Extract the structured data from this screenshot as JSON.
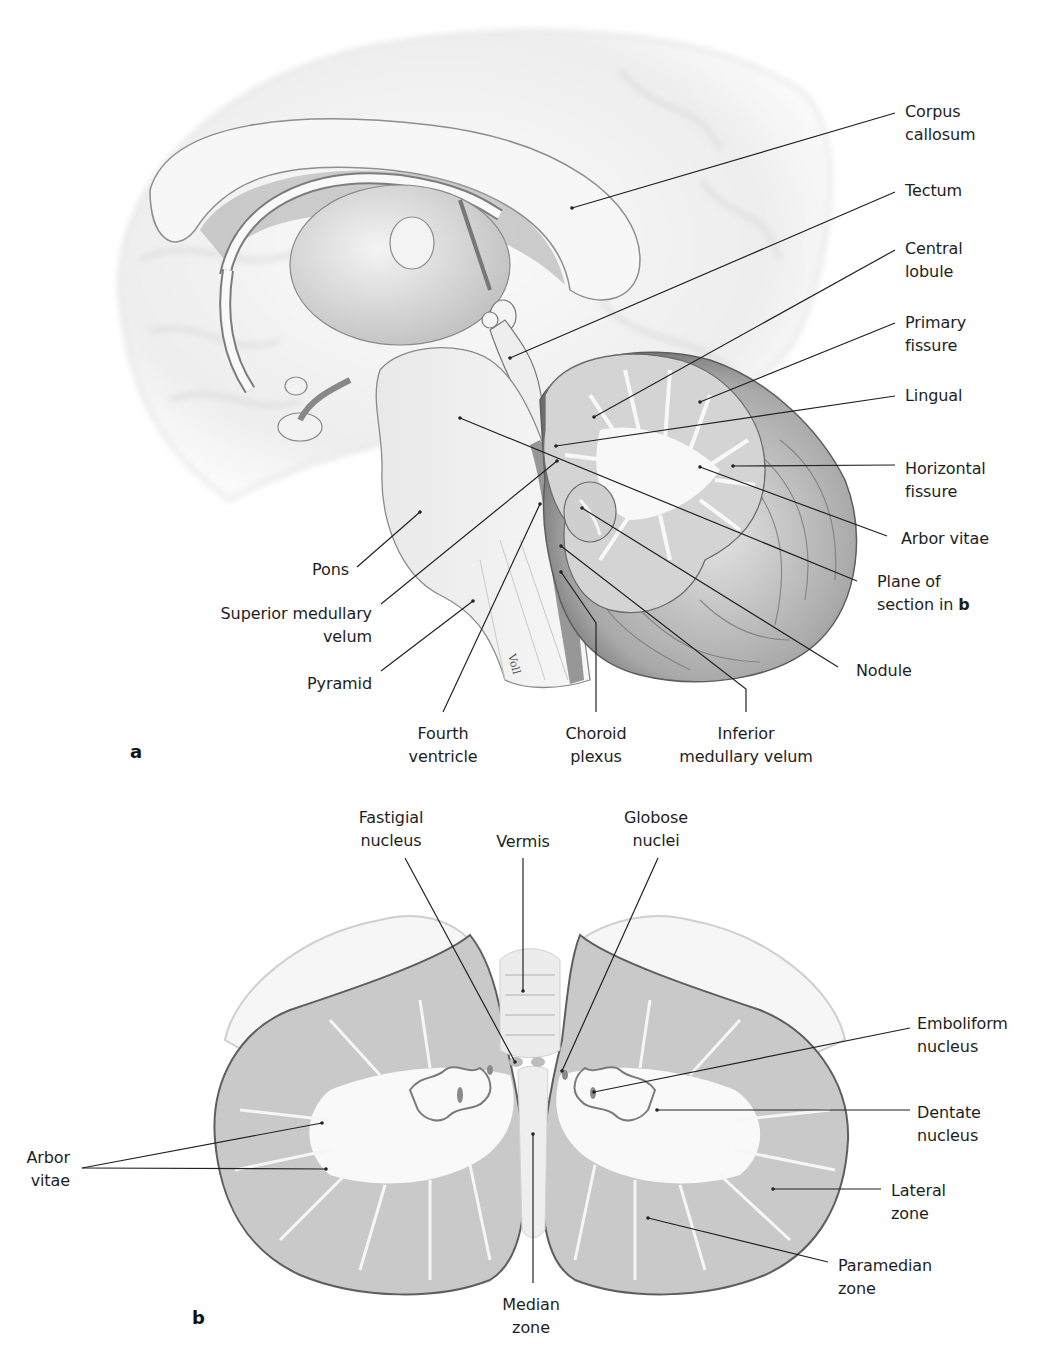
{
  "figure": {
    "panel_a": {
      "letter": "a",
      "labels": [
        {
          "id": "corpus-callosum",
          "text": "Corpus\ncallosum",
          "x": 905,
          "y": 100,
          "align": "left"
        },
        {
          "id": "tectum",
          "text": "Tectum",
          "x": 905,
          "y": 179,
          "align": "left"
        },
        {
          "id": "central-lobule",
          "text": "Central\nlobule",
          "x": 905,
          "y": 237,
          "align": "left"
        },
        {
          "id": "primary-fissure",
          "text": "Primary\nfissure",
          "x": 905,
          "y": 311,
          "align": "left"
        },
        {
          "id": "lingual",
          "text": "Lingual",
          "x": 905,
          "y": 384,
          "align": "left"
        },
        {
          "id": "horizontal-fissure",
          "text": "Horizontal\nfissure",
          "x": 905,
          "y": 457,
          "align": "left"
        },
        {
          "id": "arbor-vitae-a",
          "text": "Arbor vitae",
          "x": 901,
          "y": 527,
          "align": "left"
        },
        {
          "id": "plane-of-section",
          "text": "Plane of\nsection in ",
          "bold_suffix": "b",
          "x": 877,
          "y": 570,
          "align": "left"
        },
        {
          "id": "nodule",
          "text": "Nodule",
          "x": 856,
          "y": 659,
          "align": "left"
        },
        {
          "id": "pons",
          "text": "Pons",
          "x": 349,
          "y": 558,
          "align": "right"
        },
        {
          "id": "superior-medullary-velum",
          "text": "Superior medullary\nvelum",
          "x": 372,
          "y": 602,
          "align": "right"
        },
        {
          "id": "pyramid",
          "text": "Pyramid",
          "x": 372,
          "y": 672,
          "align": "right"
        },
        {
          "id": "fourth-ventricle",
          "text": "Fourth\nventricle",
          "x": 443,
          "y": 722,
          "align": "center"
        },
        {
          "id": "choroid-plexus",
          "text": "Choroid\nplexus",
          "x": 596,
          "y": 722,
          "align": "center"
        },
        {
          "id": "inferior-medullary-velum",
          "text": "Inferior\nmedullary velum",
          "x": 746,
          "y": 722,
          "align": "center"
        }
      ],
      "leaders": [
        {
          "for": "corpus-callosum",
          "points": [
            [
              895,
              113
            ],
            [
              572,
              208
            ]
          ]
        },
        {
          "for": "tectum",
          "points": [
            [
              895,
              192
            ],
            [
              510,
              358
            ]
          ]
        },
        {
          "for": "central-lobule",
          "points": [
            [
              895,
              250
            ],
            [
              594,
              417
            ]
          ]
        },
        {
          "for": "primary-fissure",
          "points": [
            [
              895,
              323
            ],
            [
              700,
              402
            ]
          ]
        },
        {
          "for": "lingual",
          "points": [
            [
              895,
              396
            ],
            [
              556,
              446
            ]
          ]
        },
        {
          "for": "horizontal-fissure",
          "points": [
            [
              895,
              465
            ],
            [
              733,
              466
            ]
          ]
        },
        {
          "for": "arbor-vitae-a",
          "points": [
            [
              887,
              536
            ],
            [
              700,
              467
            ]
          ]
        },
        {
          "for": "plane-of-section",
          "points": [
            [
              857,
              581
            ],
            [
              460,
              418
            ]
          ]
        },
        {
          "for": "nodule",
          "points": [
            [
              838,
              667
            ],
            [
              582,
              508
            ]
          ]
        },
        {
          "for": "pons",
          "points": [
            [
              357,
              567
            ],
            [
              420,
              512
            ]
          ]
        },
        {
          "for": "superior-medullary-velum",
          "points": [
            [
              381,
              604
            ],
            [
              557,
              461
            ]
          ]
        },
        {
          "for": "pyramid",
          "points": [
            [
              381,
              671
            ],
            [
              473,
              601
            ]
          ]
        },
        {
          "for": "fourth-ventricle",
          "points": [
            [
              443,
              712
            ],
            [
              540,
              504
            ]
          ]
        },
        {
          "for": "choroid-plexus",
          "points": [
            [
              596,
              712
            ],
            [
              596,
              623
            ],
            [
              561,
              572
            ]
          ]
        },
        {
          "for": "inferior-medullary-velum",
          "points": [
            [
              746,
              712
            ],
            [
              746,
              689
            ],
            [
              561,
              546
            ]
          ]
        }
      ]
    },
    "panel_b": {
      "letter": "b",
      "labels": [
        {
          "id": "fastigial-nucleus",
          "text": "Fastigial\nnucleus",
          "x": 391,
          "y": 806,
          "align": "center"
        },
        {
          "id": "vermis",
          "text": "Vermis",
          "x": 523,
          "y": 830,
          "align": "center"
        },
        {
          "id": "globose-nuclei",
          "text": "Globose\nnuclei",
          "x": 656,
          "y": 806,
          "align": "center"
        },
        {
          "id": "emboliform-nucleus",
          "text": "Emboliform\nnucleus",
          "x": 917,
          "y": 1012,
          "align": "left"
        },
        {
          "id": "dentate-nucleus",
          "text": "Dentate\nnucleus",
          "x": 917,
          "y": 1101,
          "align": "left"
        },
        {
          "id": "lateral-zone",
          "text": "Lateral\nzone",
          "x": 891,
          "y": 1179,
          "align": "left"
        },
        {
          "id": "paramedian-zone",
          "text": "Paramedian\nzone",
          "x": 838,
          "y": 1254,
          "align": "left"
        },
        {
          "id": "arbor-vitae-b",
          "text": "Arbor\nvitae",
          "x": 70,
          "y": 1146,
          "align": "right"
        },
        {
          "id": "median-zone",
          "text": "Median\nzone",
          "x": 531,
          "y": 1293,
          "align": "center"
        }
      ],
      "leaders": [
        {
          "for": "fastigial-nucleus",
          "points": [
            [
              405,
              858
            ],
            [
              515,
              1062
            ]
          ]
        },
        {
          "for": "vermis",
          "points": [
            [
              523,
              858
            ],
            [
              523,
              991
            ]
          ]
        },
        {
          "for": "globose-nuclei",
          "points": [
            [
              658,
              858
            ],
            [
              562,
              1071
            ]
          ]
        },
        {
          "for": "emboliform-nucleus",
          "points": [
            [
              910,
              1028
            ],
            [
              594,
              1092
            ]
          ]
        },
        {
          "for": "dentate-nucleus",
          "points": [
            [
              910,
              1110
            ],
            [
              657,
              1110
            ]
          ]
        },
        {
          "for": "lateral-zone",
          "points": [
            [
              881,
              1189
            ],
            [
              773,
              1189
            ]
          ]
        },
        {
          "for": "paramedian-zone",
          "points": [
            [
              828,
              1262
            ],
            [
              648,
              1218
            ]
          ]
        },
        {
          "for": "arbor-vitae-b-1",
          "points": [
            [
              82,
              1168
            ],
            [
              322,
              1123
            ]
          ]
        },
        {
          "for": "arbor-vitae-b-2",
          "points": [
            [
              82,
              1168
            ],
            [
              326,
              1169
            ]
          ]
        },
        {
          "for": "median-zone",
          "points": [
            [
              533,
              1283
            ],
            [
              533,
              1134
            ]
          ]
        }
      ]
    },
    "signature": "Voll"
  },
  "colors": {
    "line": "#222222",
    "text": "#1e1e1e",
    "cortex_gray": "#c8c8c8",
    "white_matter": "#f6f6f6",
    "shadow": "#6c6c6c"
  }
}
